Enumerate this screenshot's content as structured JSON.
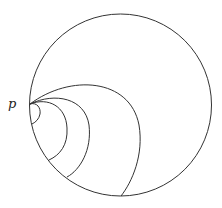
{
  "diagram": {
    "point_label": "p",
    "outer_circle": {
      "cx": 120.5,
      "cy": 105,
      "r": 91
    },
    "point": {
      "x": 30,
      "y": 104
    },
    "arcs": [
      {
        "name": "arc-1",
        "end": {
          "x": 121,
          "y": 196
        },
        "rx": 55,
        "ry": 52
      },
      {
        "name": "arc-2",
        "end": {
          "x": 67,
          "y": 177
        },
        "rx": 32,
        "ry": 38
      },
      {
        "name": "arc-3",
        "end": {
          "x": 49,
          "y": 160
        },
        "rx": 24,
        "ry": 29
      },
      {
        "name": "arc-4",
        "end": {
          "x": 32,
          "y": 124
        },
        "rx": 9,
        "ry": 10
      }
    ],
    "stroke_color": "#333333"
  }
}
